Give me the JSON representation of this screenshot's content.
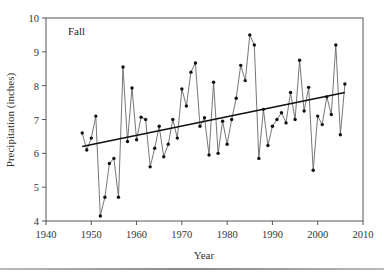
{
  "chart_data": {
    "type": "line",
    "title": "",
    "panel_label": "Fall",
    "xlabel": "Year",
    "ylabel": "Precipitation (inches)",
    "xlim": [
      1940,
      2010
    ],
    "ylim": [
      4,
      10
    ],
    "xticks": [
      1940,
      1950,
      1960,
      1970,
      1980,
      1990,
      2000,
      2010
    ],
    "yticks": [
      4,
      5,
      6,
      7,
      8,
      9,
      10
    ],
    "grid": false,
    "legend": null,
    "series": [
      {
        "name": "Fall precipitation",
        "style": "line-with-markers",
        "color": "#555555",
        "x": [
          1948,
          1949,
          1950,
          1951,
          1952,
          1953,
          1954,
          1955,
          1956,
          1957,
          1958,
          1959,
          1960,
          1961,
          1962,
          1963,
          1964,
          1965,
          1966,
          1967,
          1968,
          1969,
          1970,
          1971,
          1972,
          1973,
          1974,
          1975,
          1976,
          1977,
          1978,
          1979,
          1980,
          1981,
          1982,
          1983,
          1984,
          1985,
          1986,
          1987,
          1988,
          1989,
          1990,
          1991,
          1992,
          1993,
          1994,
          1995,
          1996,
          1997,
          1998,
          1999,
          2000,
          2001,
          2002,
          2003,
          2004,
          2005,
          2006
        ],
        "values": [
          6.6,
          6.1,
          6.45,
          7.1,
          4.15,
          4.7,
          5.7,
          5.85,
          4.7,
          8.55,
          6.35,
          7.93,
          6.4,
          7.07,
          7.0,
          5.6,
          6.15,
          6.8,
          5.9,
          6.27,
          7.0,
          6.45,
          7.9,
          7.4,
          8.4,
          8.67,
          6.8,
          7.05,
          5.95,
          8.1,
          6.0,
          6.95,
          6.27,
          7.0,
          7.63,
          8.6,
          8.15,
          9.5,
          9.2,
          5.85,
          7.3,
          6.23,
          6.8,
          7.0,
          7.2,
          6.9,
          7.8,
          7.0,
          8.75,
          7.25,
          7.95,
          5.5,
          7.1,
          6.85,
          7.67,
          7.15,
          9.2,
          6.55,
          8.05
        ]
      },
      {
        "name": "Linear trend",
        "style": "line",
        "color": "#111111",
        "x": [
          1948,
          2006
        ],
        "values": [
          6.2,
          7.8
        ]
      }
    ]
  }
}
